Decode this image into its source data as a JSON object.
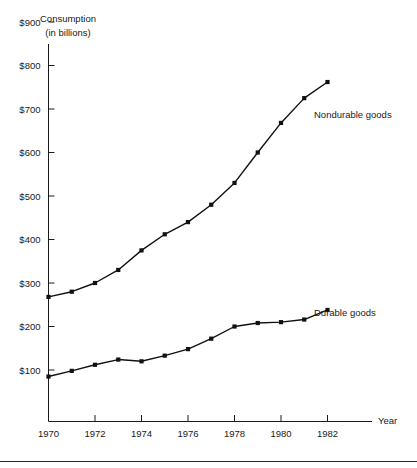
{
  "chart_data": {
    "type": "line",
    "title": "",
    "ylabel_lines": [
      "Consumption",
      "(in billions)"
    ],
    "xlabel": "Year",
    "x": [
      1970,
      1971,
      1972,
      1973,
      1974,
      1975,
      1976,
      1977,
      1978,
      1979,
      1980,
      1981,
      1982
    ],
    "categories": [
      "1970",
      "1971",
      "1972",
      "1973",
      "1974",
      "1975",
      "1976",
      "1977",
      "1978",
      "1979",
      "1980",
      "1981",
      "1982"
    ],
    "xtick_labels": [
      "1970",
      "1972",
      "1974",
      "1976",
      "1978",
      "1980",
      "1982"
    ],
    "xtick_values": [
      1970,
      1972,
      1974,
      1976,
      1978,
      1980,
      1982
    ],
    "ytick_labels": [
      "$100",
      "$200",
      "$300",
      "$400",
      "$500",
      "$600",
      "$700",
      "$800",
      "$900"
    ],
    "ytick_values": [
      100,
      200,
      300,
      400,
      500,
      600,
      700,
      800,
      900
    ],
    "xlim": [
      1970,
      1982
    ],
    "ylim": [
      0,
      950
    ],
    "grid": false,
    "legend_position": "inline-right",
    "series": [
      {
        "name": "Nondurable goods",
        "label": "Nondurable goods",
        "color": "#111111",
        "values": [
          268,
          280,
          300,
          330,
          375,
          412,
          440,
          480,
          530,
          600,
          668,
          725,
          762
        ]
      },
      {
        "name": "Durable goods",
        "label": "Durable goods",
        "color": "#111111",
        "values": [
          85,
          98,
          112,
          124,
          120,
          133,
          148,
          172,
          200,
          208,
          210,
          216,
          238
        ]
      }
    ],
    "annotations": [
      {
        "text": "Nondurable goods",
        "series": "Nondurable goods"
      },
      {
        "text": "Durable goods",
        "series": "Durable goods"
      }
    ]
  }
}
